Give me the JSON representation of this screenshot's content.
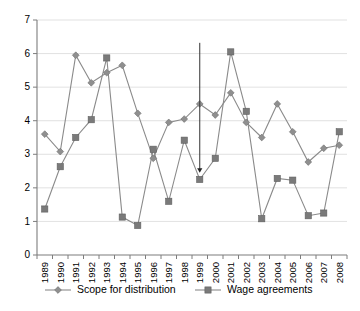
{
  "chart_data": {
    "type": "line",
    "title": "",
    "subtitle": "",
    "xlabel": "",
    "ylabel": "",
    "ylim": [
      0,
      7
    ],
    "ytick_values": [
      0,
      1,
      2,
      3,
      4,
      5,
      6,
      7
    ],
    "ytick_labels": [
      "0",
      "1",
      "2",
      "3",
      "4",
      "5",
      "6",
      "7"
    ],
    "grid": true,
    "grid_axis": "y",
    "legend_position": "bottom",
    "categories": [
      "1989",
      "1990",
      "1991",
      "1992",
      "1993",
      "1994",
      "1995",
      "1996",
      "1997",
      "1998",
      "1999",
      "2000",
      "2001",
      "2002",
      "2003",
      "2004",
      "2005",
      "2006",
      "2007",
      "2008"
    ],
    "series": [
      {
        "name": "Scope for distribution",
        "marker": "diamond",
        "color": "#8f8f8f",
        "values": [
          3.6,
          3.08,
          5.95,
          5.13,
          5.43,
          5.65,
          4.22,
          2.88,
          3.95,
          4.05,
          4.5,
          4.17,
          4.83,
          3.95,
          3.5,
          4.5,
          3.67,
          2.77,
          3.18,
          3.27
        ]
      },
      {
        "name": "Wage agreements",
        "marker": "square",
        "color": "#7a7a7a",
        "values": [
          1.37,
          2.63,
          3.5,
          4.03,
          5.87,
          1.13,
          0.88,
          3.15,
          1.6,
          3.42,
          2.25,
          2.88,
          6.05,
          4.28,
          1.08,
          2.28,
          2.23,
          1.17,
          1.25,
          3.67
        ]
      }
    ],
    "annotations": [
      {
        "type": "arrow",
        "target_category": "1999",
        "target_series": "Wage agreements",
        "target_value": 2.45,
        "start_value": 6.32
      }
    ]
  },
  "legend": {
    "items": [
      {
        "label": "Scope for distribution",
        "marker": "diamond"
      },
      {
        "label": "Wage agreements",
        "marker": "square"
      }
    ]
  }
}
